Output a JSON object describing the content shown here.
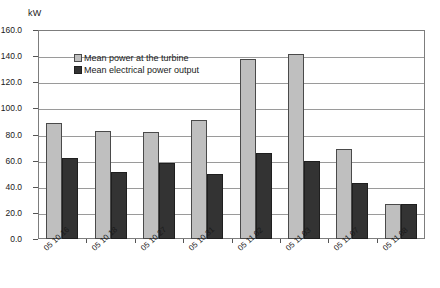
{
  "chart_data": {
    "type": "bar",
    "title": "",
    "subtitle": "",
    "xlabel": "",
    "ylabel": "kW",
    "ylim": [
      0,
      160
    ],
    "ytick_step": 20,
    "ytick_labels": [
      "0.0",
      "20.0",
      "40.0",
      "60.0",
      "80.0",
      "100.0",
      "120.0",
      "140.0",
      "160.0"
    ],
    "ytick_values": [
      0,
      20,
      40,
      60,
      80,
      100,
      120,
      140,
      160
    ],
    "grid": true,
    "legend_position": "inside-top-left",
    "categories": [
      "05 10 16",
      "05 10 18",
      "05 10 27",
      "05 10 31",
      "05 11 02",
      "05 11 03",
      "05 11 07",
      "05 11 08"
    ],
    "series": [
      {
        "name": "Mean power at the turbine",
        "color": "#bfbfbf",
        "values": [
          89.0,
          82.5,
          82.0,
          91.0,
          138.0,
          142.0,
          69.0,
          27.0
        ]
      },
      {
        "name": "Mean electrical power output",
        "color": "#333333",
        "values": [
          62.0,
          51.0,
          58.5,
          50.0,
          65.5,
          60.0,
          43.0,
          27.0
        ]
      }
    ],
    "annotations": []
  },
  "style": {
    "plot_border_color": "#7d7d7d",
    "gridline_color": "#9a9a9a",
    "background": "#ffffff",
    "text_color": "#1a1a1a"
  }
}
